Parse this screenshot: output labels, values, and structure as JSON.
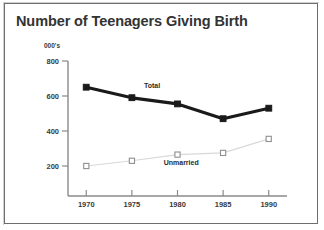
{
  "chart_data": {
    "type": "line",
    "title": "Number of Teenagers Giving Birth",
    "xlabel": "",
    "ylabel": "000's",
    "unit_label": "000's",
    "categories": [
      "1970",
      "1975",
      "1980",
      "1985",
      "1990"
    ],
    "x": [
      1970,
      1975,
      1980,
      1985,
      1990
    ],
    "xlim": [
      1968,
      1992
    ],
    "ylim": [
      0,
      800
    ],
    "ytick_labels": [
      "800",
      "600",
      "400",
      "200"
    ],
    "yticks": [
      800,
      600,
      400,
      200
    ],
    "grid": false,
    "legend_position": "inline-annotations",
    "series": [
      {
        "name": "Total",
        "values": [
          650,
          590,
          555,
          470,
          530
        ],
        "color": "#1a1a1a",
        "marker": "filled-square",
        "line_width": 3.2,
        "annotation": "Total"
      },
      {
        "name": "Unmarried",
        "values": [
          200,
          230,
          265,
          275,
          355
        ],
        "color": "#d8d8d8",
        "marker": "open-square",
        "line_width": 1.1,
        "annotation": "Unmarried"
      }
    ],
    "annotations": [
      {
        "text": "Total",
        "x": 1977.2,
        "y": 645
      },
      {
        "text": "Unmarried",
        "x": 1980.4,
        "y": 207
      }
    ]
  },
  "frame": {
    "border_color": "#6e6e6e",
    "background": "#ffffff"
  },
  "icons": {}
}
